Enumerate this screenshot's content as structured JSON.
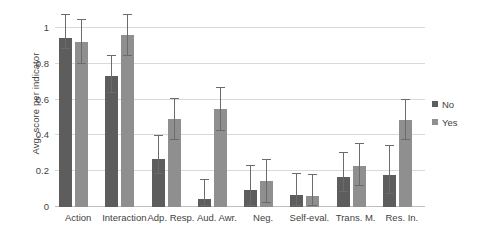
{
  "chart_data": {
    "type": "bar",
    "title": "",
    "xlabel": "",
    "ylabel": "Avg. score per indicator",
    "ylim": [
      0,
      1
    ],
    "yticks": [
      0,
      0.2,
      0.4,
      0.6,
      0.8,
      1
    ],
    "ytick_labels": [
      "0",
      "0.2",
      "0.4",
      "0.6",
      "0.8",
      "1"
    ],
    "grid": true,
    "legend_position": "right",
    "categories": [
      "Action",
      "Interaction",
      "Adp. Resp.",
      "Aud. Awr.",
      "Neg.",
      "Self-eval.",
      "Trans. M.",
      "Res. In."
    ],
    "series": [
      {
        "name": "No",
        "color": "#5d5d5d",
        "values": [
          0.945,
          0.73,
          0.27,
          0.045,
          0.095,
          0.065,
          0.17,
          0.18
        ],
        "error_low": [
          0.885,
          0.635,
          0.185,
          0.005,
          0.005,
          0.005,
          0.085,
          0.075
        ],
        "error_high": [
          1.075,
          0.845,
          0.395,
          0.15,
          0.23,
          0.185,
          0.3,
          0.34
        ]
      },
      {
        "name": "Yes",
        "color": "#8f8f8f",
        "values": [
          0.92,
          0.96,
          0.49,
          0.545,
          0.145,
          0.06,
          0.23,
          0.485
        ],
        "error_low": [
          0.8,
          0.845,
          0.375,
          0.425,
          0.025,
          0.005,
          0.115,
          0.375
        ],
        "error_high": [
          1.045,
          1.075,
          0.605,
          0.665,
          0.26,
          0.18,
          0.35,
          0.6
        ]
      }
    ],
    "legend": [
      {
        "label": "No",
        "color": "#5d5d5d"
      },
      {
        "label": "Yes",
        "color": "#8f8f8f"
      }
    ]
  }
}
